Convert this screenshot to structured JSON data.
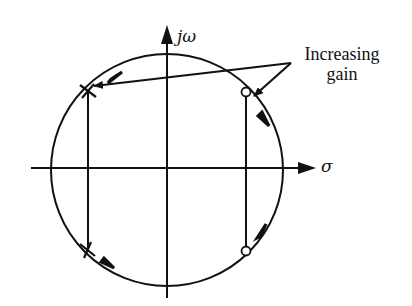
{
  "diagram": {
    "type": "root-locus",
    "axes": {
      "imaginary_label": "jω",
      "real_label": "σ"
    },
    "annotation": {
      "line1": "Increasing",
      "line2": "gain"
    },
    "markers": {
      "poles": [
        {
          "symbol": "×",
          "position": "upper-left"
        },
        {
          "symbol": "×",
          "position": "lower-left"
        }
      ],
      "zeros": [
        {
          "symbol": "○",
          "position": "upper-right"
        },
        {
          "symbol": "○",
          "position": "lower-right"
        }
      ]
    },
    "colors": {
      "ink": "#111111",
      "background": "#ffffff"
    }
  }
}
